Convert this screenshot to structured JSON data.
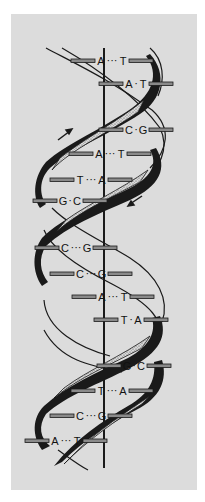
{
  "figure": {
    "background_color": "#dcdcdc",
    "strand_color": "#1a1a1a",
    "axis_color": "#1a1a1a"
  },
  "base_pairs": [
    {
      "left": "A",
      "right": "T",
      "y": 61,
      "cx": 112,
      "style": "dots"
    },
    {
      "left": "A",
      "right": "T",
      "y": 84,
      "cx": 136,
      "style": "dash"
    },
    {
      "left": "C",
      "right": "G",
      "y": 130,
      "cx": 136,
      "style": "dash"
    },
    {
      "left": "A",
      "right": "T",
      "y": 154,
      "cx": 110,
      "style": "dots"
    },
    {
      "left": "T",
      "right": "A",
      "y": 180,
      "cx": 91,
      "style": "dots"
    },
    {
      "left": "G",
      "right": "C",
      "y": 201,
      "cx": 70,
      "style": "dash"
    },
    {
      "left": "C",
      "right": "G",
      "y": 248,
      "cx": 76,
      "style": "dots"
    },
    {
      "left": "C",
      "right": "G",
      "y": 274,
      "cx": 91,
      "style": "dots"
    },
    {
      "left": "A",
      "right": "T",
      "y": 297,
      "cx": 113,
      "style": "dots"
    },
    {
      "left": "T",
      "right": "A",
      "y": 320,
      "cx": 131,
      "style": "dash"
    },
    {
      "left": "G",
      "right": "C",
      "y": 366,
      "cx": 134,
      "style": "dash"
    },
    {
      "left": "T",
      "right": "A",
      "y": 391,
      "cx": 112,
      "style": "dots"
    },
    {
      "left": "C",
      "right": "G",
      "y": 416,
      "cx": 91,
      "style": "dots"
    },
    {
      "left": "A",
      "right": "T",
      "y": 441,
      "cx": 66,
      "style": "dots"
    }
  ],
  "arrows": [
    {
      "direction": "up-right",
      "x": 62,
      "y": 135
    },
    {
      "direction": "down-left",
      "x": 136,
      "y": 198
    }
  ]
}
